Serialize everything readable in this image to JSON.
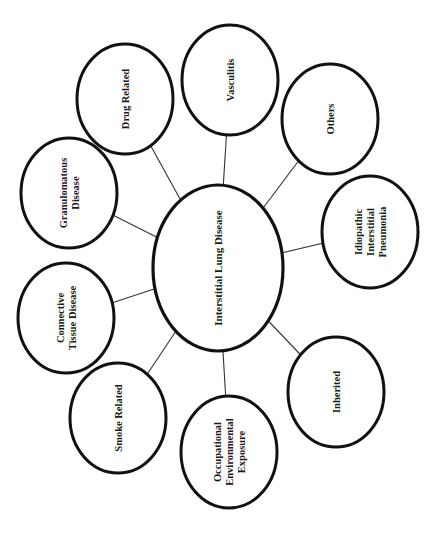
{
  "diagram": {
    "title": "Interstitial Lung Disease",
    "orientation": "rotated 90 degrees counterclockwise",
    "center": {
      "id": "interstitial-lung-disease",
      "label_lines": [
        "Interstitial Lung Disease"
      ]
    },
    "nodes": [
      {
        "id": "drug-related",
        "label_lines": [
          "Drug Related"
        ]
      },
      {
        "id": "vasculitis",
        "label_lines": [
          "Vasculitis"
        ]
      },
      {
        "id": "others",
        "label_lines": [
          "Others"
        ]
      },
      {
        "id": "idiopathic-interstitial-pneumonia",
        "label_lines": [
          "Idiopathic",
          "Interstitial",
          "Pneumonia"
        ]
      },
      {
        "id": "inherited",
        "label_lines": [
          "Inherited"
        ]
      },
      {
        "id": "occupational-environmental-exposure",
        "label_lines": [
          "Occupational",
          "Environmental",
          "Exposure"
        ]
      },
      {
        "id": "smoke-related",
        "label_lines": [
          "Smoke Related"
        ]
      },
      {
        "id": "connective-tissue-disease",
        "label_lines": [
          "Connective",
          "Tissue Disease"
        ]
      },
      {
        "id": "granulomatous-disease",
        "label_lines": [
          "Granulomatous",
          "Disease"
        ]
      }
    ],
    "edges": [
      [
        "interstitial-lung-disease",
        "drug-related"
      ],
      [
        "interstitial-lung-disease",
        "vasculitis"
      ],
      [
        "interstitial-lung-disease",
        "others"
      ],
      [
        "interstitial-lung-disease",
        "idiopathic-interstitial-pneumonia"
      ],
      [
        "interstitial-lung-disease",
        "inherited"
      ],
      [
        "interstitial-lung-disease",
        "occupational-environmental-exposure"
      ],
      [
        "interstitial-lung-disease",
        "smoke-related"
      ],
      [
        "interstitial-lung-disease",
        "connective-tissue-disease"
      ],
      [
        "interstitial-lung-disease",
        "granulomatous-disease"
      ]
    ],
    "colors": {
      "stroke": "#111111",
      "connector": "#333333",
      "fill": "#ffffff",
      "text": "#1a1a1a"
    }
  }
}
